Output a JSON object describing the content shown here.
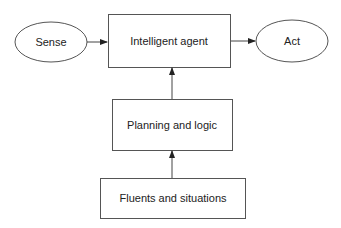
{
  "diagram": {
    "colors": {
      "stroke": "#555555",
      "text": "#222222",
      "background": "#ffffff"
    },
    "nodes": {
      "sense": {
        "label": "Sense",
        "shape": "ellipse"
      },
      "agent": {
        "label": "Intelligent agent",
        "shape": "rectangle"
      },
      "act": {
        "label": "Act",
        "shape": "ellipse"
      },
      "planning": {
        "label": "Planning and logic",
        "shape": "rectangle"
      },
      "fluents": {
        "label": "Fluents and situations",
        "shape": "rectangle"
      }
    },
    "edges": [
      {
        "from": "sense",
        "to": "agent"
      },
      {
        "from": "agent",
        "to": "act"
      },
      {
        "from": "planning",
        "to": "agent"
      },
      {
        "from": "fluents",
        "to": "planning"
      }
    ]
  }
}
